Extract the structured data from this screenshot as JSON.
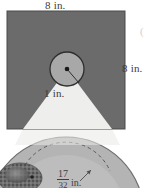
{
  "figure": {
    "title_alt": "Square with inscribed circle and light cone",
    "labels": {
      "top_width": "8 in.",
      "right_height": "8 in.",
      "circle_radius": "1 in.",
      "corner_mark": "(",
      "arc_numerator": "17",
      "arc_denominator": "32",
      "arc_unit": "in."
    },
    "colors": {
      "square_fill": "#6b6b6b",
      "square_stroke": "#4a4a4a",
      "cone_fill": "#eeeeec",
      "circle_fill": "#a8a8a8",
      "circle_stroke": "#2e2e2e",
      "center_dot": "#1a1a1a",
      "radius_line": "#2e2e2e",
      "lower_circle_fill": "#b4b4b4",
      "lower_circle_stroke": "#6f6f6f",
      "lower_inner_fill": "#c2c2c2",
      "dashed_arc": "#5a5a5a",
      "texture_blob": "#6a6a6a",
      "background": "#ffffff",
      "text": "#3b3b3b"
    },
    "geometry": {
      "square": {
        "x": 7,
        "y": 11,
        "width": 118,
        "height": 118
      },
      "circle": {
        "cx": 67,
        "cy": 69,
        "r": 17
      },
      "center_dot_r": 2.2,
      "radius_endpoint": {
        "x": 79,
        "y": 82
      },
      "cone_apex": {
        "x": 67,
        "y": 69
      },
      "cone_base_left": {
        "x": 23,
        "y": 129
      },
      "cone_base_right": {
        "x": 112,
        "y": 129
      },
      "lower_circle": {
        "cx": 66,
        "cy": 215,
        "r": 78
      },
      "lower_inner_arc": {
        "cx": 66,
        "cy": 215,
        "r": 48
      }
    }
  }
}
